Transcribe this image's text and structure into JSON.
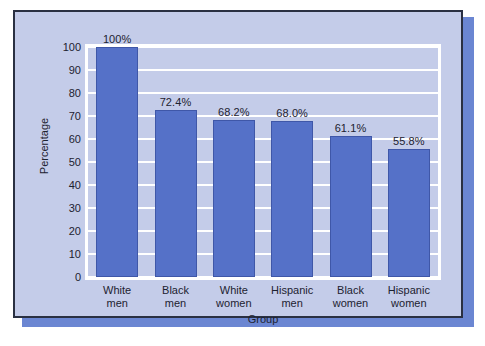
{
  "chart_data": {
    "type": "bar",
    "title": "",
    "subtitle": "",
    "xlabel": "Group",
    "ylabel": "Percentage",
    "categories": [
      "White men",
      "Black men",
      "White women",
      "Hispanic men",
      "Black women",
      "Hispanic women"
    ],
    "category_lines": [
      [
        "White",
        "men"
      ],
      [
        "Black",
        "men"
      ],
      [
        "White",
        "women"
      ],
      [
        "Hispanic",
        "men"
      ],
      [
        "Black",
        "women"
      ],
      [
        "Hispanic",
        "women"
      ]
    ],
    "values": [
      100,
      72.4,
      68.2,
      68.0,
      61.1,
      55.8
    ],
    "data_labels": [
      "100%",
      "72.4%",
      "68.2%",
      "68.0%",
      "61.1%",
      "55.8%"
    ],
    "ylim": [
      0,
      100
    ],
    "ytick_values": [
      0,
      10,
      20,
      30,
      40,
      50,
      60,
      70,
      80,
      90,
      100
    ],
    "ytick_labels": [
      "0",
      "10",
      "20",
      "30",
      "40",
      "50",
      "60",
      "70",
      "80",
      "90",
      "100"
    ],
    "grid": true,
    "grid_orientation": "horizontal",
    "legend": false,
    "legend_position": "none",
    "colors": {
      "bar_fill": "#5571c8",
      "bar_edge": "#3f57a8",
      "plot_background": "#c4cce9",
      "card_background": "#c4cce9",
      "card_border": "#2a3042",
      "gridline": "#ffffff",
      "plot_frame": "#ffffff",
      "shadow": "#6b86d2",
      "text": "#1d2230",
      "page_background": "#ffffff"
    }
  }
}
